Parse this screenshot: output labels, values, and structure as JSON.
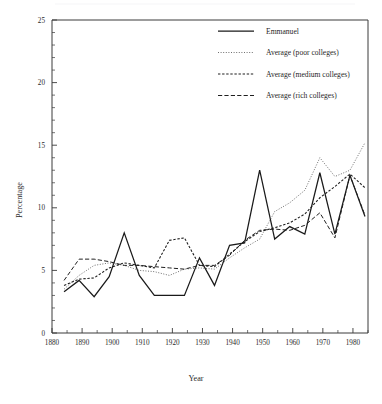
{
  "chart_data": {
    "type": "line",
    "title": "",
    "xlabel": "Year",
    "ylabel": "Percentage",
    "xlim": [
      1880,
      1985
    ],
    "ylim": [
      0,
      25
    ],
    "grid": false,
    "legend_position": "top-right",
    "x_major_ticks": [
      1880,
      1890,
      1900,
      1910,
      1920,
      1930,
      1940,
      1950,
      1960,
      1970,
      1980
    ],
    "x_minor_ticks": [
      1885,
      1895,
      1905,
      1915,
      1925,
      1935,
      1945,
      1955,
      1965,
      1975,
      1985
    ],
    "y_major_ticks": [
      0,
      5,
      10,
      15,
      20,
      25
    ],
    "y_minor_step": 1,
    "series": [
      {
        "name": "Emmanuel",
        "style": "solid",
        "color": "#1a1a1a",
        "x": [
          1884,
          1889,
          1894,
          1899,
          1904,
          1909,
          1914,
          1919,
          1924,
          1929,
          1934,
          1939,
          1944,
          1949,
          1954,
          1959,
          1964,
          1969,
          1974,
          1979,
          1984
        ],
        "values": [
          3.3,
          4.2,
          2.9,
          4.5,
          8.0,
          4.6,
          3.0,
          3.0,
          3.0,
          6.0,
          3.8,
          7.0,
          7.2,
          13.0,
          7.5,
          8.5,
          7.9,
          12.8,
          7.9,
          12.6,
          9.3
        ]
      },
      {
        "name": "Average (poor colleges)",
        "style": "dotted-fine",
        "color": "#555555",
        "x": [
          1884,
          1889,
          1894,
          1899,
          1904,
          1909,
          1914,
          1919,
          1924,
          1929,
          1934,
          1939,
          1944,
          1949,
          1954,
          1959,
          1964,
          1969,
          1974,
          1979,
          1984
        ],
        "values": [
          3.5,
          4.6,
          5.4,
          5.6,
          5.4,
          5.0,
          4.9,
          4.6,
          5.1,
          5.2,
          5.1,
          6.0,
          6.8,
          7.5,
          9.7,
          10.4,
          11.4,
          14.0,
          12.5,
          13.0,
          15.2
        ]
      },
      {
        "name": "Average (medium colleges)",
        "style": "dashed-short",
        "color": "#1f1f1f",
        "x": [
          1884,
          1889,
          1894,
          1899,
          1904,
          1909,
          1914,
          1919,
          1924,
          1929,
          1934,
          1939,
          1944,
          1949,
          1954,
          1959,
          1964,
          1969,
          1974,
          1979,
          1984
        ],
        "values": [
          3.8,
          4.3,
          4.4,
          5.2,
          5.6,
          5.4,
          5.2,
          7.4,
          7.6,
          5.4,
          5.3,
          6.3,
          7.3,
          8.1,
          8.4,
          8.8,
          9.5,
          10.8,
          11.7,
          12.7,
          11.6
        ]
      },
      {
        "name": "Average (rich colleges)",
        "style": "dashed-long",
        "color": "#1f1f1f",
        "x": [
          1884,
          1889,
          1894,
          1899,
          1904,
          1909,
          1914,
          1919,
          1924,
          1929,
          1934,
          1939,
          1944,
          1949,
          1954,
          1959,
          1964,
          1969,
          1974,
          1979,
          1984
        ],
        "values": [
          4.2,
          5.9,
          5.9,
          5.7,
          5.4,
          5.4,
          5.3,
          5.2,
          5.1,
          5.4,
          5.4,
          6.2,
          7.4,
          8.2,
          8.3,
          8.2,
          8.6,
          9.6,
          7.6,
          12.6,
          9.4
        ]
      }
    ]
  },
  "axis": {
    "y_title": "Percentage",
    "x_title": "Year",
    "y_labels": [
      "0",
      "5",
      "10",
      "15",
      "20",
      "25"
    ],
    "x_labels": [
      "1880",
      "1890",
      "1900",
      "1910",
      "1920",
      "1930",
      "1940",
      "1950",
      "1960",
      "1970",
      "1980"
    ]
  },
  "legend": {
    "items": [
      {
        "label": "Emmanuel",
        "style": "solid"
      },
      {
        "label": "Average (poor colleges)",
        "style": "dotted-fine"
      },
      {
        "label": "Average (medium colleges)",
        "style": "dashed-short"
      },
      {
        "label": "Average (rich colleges)",
        "style": "dashed-long"
      }
    ]
  }
}
